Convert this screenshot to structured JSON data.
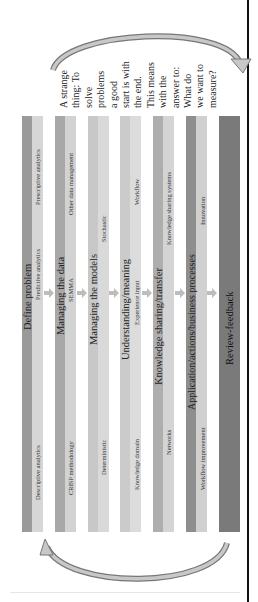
{
  "diagram": {
    "note_lines": [
      "A strange",
      "thing: To",
      "solve",
      "problems",
      "a good",
      "start is with",
      "the end.",
      "This means",
      "with the",
      "answer to:",
      "What do",
      "we want to",
      "measure?"
    ],
    "stages": [
      {
        "title": "Define problem",
        "subs": [
          "Descriptive analytics",
          "Predictive analytics",
          "Prescriptive analytics"
        ],
        "dark": "#9a9a9a",
        "light": "#d6d6d6"
      },
      {
        "title": "Managing the data",
        "subs": [
          "CRISP methodology",
          "SEMMA",
          "Other data management"
        ],
        "dark": "#a8a8a8",
        "light": "#d2d2d2"
      },
      {
        "title": "Managing the models",
        "subs": [
          "Deterministic",
          "Stochastic"
        ],
        "dark": "#c8c8c8",
        "light": "#d9d9d9"
      },
      {
        "title": "Understanding/meaning",
        "subs": [
          "Knowledge domain",
          "Experience input",
          "Workflow"
        ],
        "dark": "#cbcbcb",
        "light": "#dcdcdc"
      },
      {
        "title": "Knowledge sharing/transfer",
        "subs": [
          "Networks",
          "Knowledge sharing systems"
        ],
        "dark": "#aeaeae",
        "light": "#d4d4d4"
      },
      {
        "title": "Application/actions/business processes",
        "subs": [
          "Workflow improvement",
          "Innovation"
        ],
        "dark": "#8e8e8e",
        "light": "#d0d0d0"
      },
      {
        "title": "Review-feedback",
        "subs": [],
        "dark": "#7a7a7a",
        "light": "#7a7a7a"
      }
    ],
    "feedback_arrows": {
      "top": "curved-arrow-right",
      "bottom": "curved-arrow-left"
    }
  }
}
